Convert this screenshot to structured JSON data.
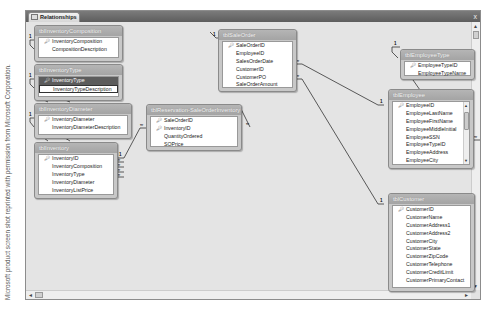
{
  "credit": "Microsoft product screen shot reprinted with permission from Microsoft Corporation.",
  "window": {
    "tab_label": "Relationships",
    "tab_icon": "relationships-icon",
    "close_glyph": "x"
  },
  "tables": [
    {
      "name": "tblInventoryComposition",
      "fields": [
        {
          "label": "InventoryComposition",
          "pk": true
        },
        {
          "label": "CompositionDescription",
          "pk": false
        }
      ]
    },
    {
      "name": "tblInventoryType",
      "fields": [
        {
          "label": "InventoryType",
          "pk": true,
          "selected": true
        },
        {
          "label": "InventoryTypeDescription",
          "pk": false
        }
      ]
    },
    {
      "name": "tblInventoryDiameter",
      "fields": [
        {
          "label": "InventoryDiameter",
          "pk": true
        },
        {
          "label": "InventoryDiameterDescription",
          "pk": false
        }
      ]
    },
    {
      "name": "tblInventory",
      "fields": [
        {
          "label": "InventoryID",
          "pk": true
        },
        {
          "label": "InventoryComposition",
          "pk": false
        },
        {
          "label": "InventoryType",
          "pk": false
        },
        {
          "label": "InventoryDiameter",
          "pk": false
        },
        {
          "label": "InventoryListPrice",
          "pk": false
        }
      ]
    },
    {
      "name": "tblReservation-SaleOrderInventory",
      "fields": [
        {
          "label": "SaleOrderID",
          "pk": true
        },
        {
          "label": "InventoryID",
          "pk": true
        },
        {
          "label": "QuantityOrdered",
          "pk": false
        },
        {
          "label": "SOPrice",
          "pk": false
        }
      ]
    },
    {
      "name": "tblSaleOrder",
      "fields": [
        {
          "label": "SaleOrderID",
          "pk": true
        },
        {
          "label": "EmployeeID",
          "pk": false
        },
        {
          "label": "SalesOrderDate",
          "pk": false
        },
        {
          "label": "CustomerID",
          "pk": false
        },
        {
          "label": "CustomerPO",
          "pk": false
        },
        {
          "label": "SaleOrderAmount",
          "pk": false
        }
      ]
    },
    {
      "name": "tblEmployeeType",
      "fields": [
        {
          "label": "EmployeeTypeID",
          "pk": true
        },
        {
          "label": "EmployeeTypeName",
          "pk": false
        }
      ]
    },
    {
      "name": "tblEmployee",
      "fields": [
        {
          "label": "EmployeeID",
          "pk": true
        },
        {
          "label": "EmployeeLastName",
          "pk": false
        },
        {
          "label": "EmployeeFirstName",
          "pk": false
        },
        {
          "label": "EmployeeMiddleInitial",
          "pk": false
        },
        {
          "label": "EmployeeSSN",
          "pk": false
        },
        {
          "label": "EmployeeTypeID",
          "pk": false
        },
        {
          "label": "EmployeeAddress",
          "pk": false
        },
        {
          "label": "EmployeeCity",
          "pk": false
        }
      ]
    },
    {
      "name": "tblCustomer",
      "fields": [
        {
          "label": "CustomerID",
          "pk": true
        },
        {
          "label": "CustomerName",
          "pk": false
        },
        {
          "label": "CustomerAddress1",
          "pk": false
        },
        {
          "label": "CustomerAddress2",
          "pk": false
        },
        {
          "label": "CustomerCity",
          "pk": false
        },
        {
          "label": "CustomerState",
          "pk": false
        },
        {
          "label": "CustomerZipCode",
          "pk": false
        },
        {
          "label": "CustomerTelephone",
          "pk": false
        },
        {
          "label": "CustomerCreditLimit",
          "pk": false
        },
        {
          "label": "CustomerPrimaryContact",
          "pk": false
        }
      ]
    }
  ],
  "cardinality": {
    "one": "1",
    "many": "∞"
  },
  "icons": {
    "key": "key-icon",
    "scroll_up": "▲",
    "scroll_down": "▼",
    "scroll_left": "◄",
    "scroll_right": "►"
  }
}
